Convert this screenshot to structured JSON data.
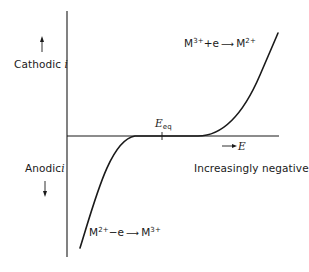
{
  "diagram": {
    "type": "current-potential curve",
    "y_axis": {
      "positive_label": "Cathodic",
      "negative_label": "Anodic",
      "symbol": "i"
    },
    "x_axis": {
      "symbol": "E",
      "direction_label": "Increasingly negative"
    },
    "equilibrium_marker": {
      "symbol": "E",
      "subscript": "eq"
    },
    "reactions": {
      "cathodic": {
        "reactant": "M",
        "reactant_charge": "3+",
        "op": "+e",
        "product": "M",
        "product_charge": "2+"
      },
      "anodic": {
        "reactant": "M",
        "reactant_charge": "2+",
        "op": "−e",
        "product": "M",
        "product_charge": "3+"
      }
    },
    "colors": {
      "line": "#1a1a1a",
      "background": "#ffffff"
    }
  }
}
